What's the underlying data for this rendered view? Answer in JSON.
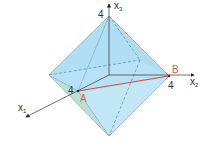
{
  "diagram": {
    "type": "octahedron-in-3d-coordinate-system",
    "axes": {
      "x1": {
        "label": "x",
        "subscript": "1",
        "tick": "4"
      },
      "x2": {
        "label": "x",
        "subscript": "2",
        "tick": "4"
      },
      "x3": {
        "label": "x",
        "subscript": "3",
        "tick": "4"
      }
    },
    "points": {
      "A": {
        "label": "A"
      },
      "B": {
        "label": "B"
      }
    },
    "colors": {
      "face_blue": "#aadcf2",
      "face_green": "#b8dccc",
      "edge": "#8aa8b4",
      "axis": "#333333",
      "segment_ab": "#d8463a",
      "point_label": "#e0604a"
    }
  }
}
